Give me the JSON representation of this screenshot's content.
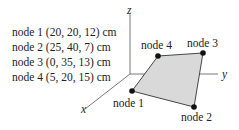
{
  "node_list": [
    {
      "label": "node 1 (20, 20, 12) cm"
    },
    {
      "label": "node 2 (25, 40, 7) cm"
    },
    {
      "label": "node 3 (0, 35, 13) cm"
    },
    {
      "label": "node 4 (5, 20, 15) cm"
    }
  ],
  "axes": {
    "x": "x",
    "y": "y",
    "z": "z"
  },
  "nodes": {
    "n1": "node 1",
    "n2": "node 2",
    "n3": "node 3",
    "n4": "node 4"
  },
  "colors": {
    "fill": "#d9d9d9",
    "stroke": "#333333",
    "dot": "#111111"
  }
}
